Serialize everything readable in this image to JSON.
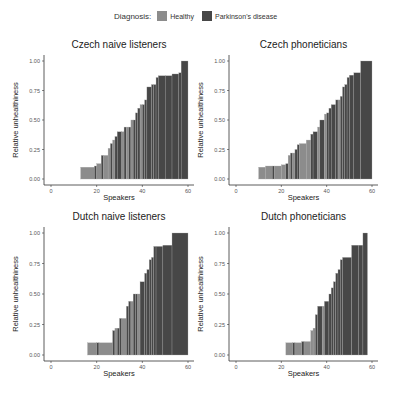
{
  "legend": {
    "title": "Diagnosis:",
    "items": [
      {
        "label": "Healthy",
        "color": "#8c8c8c"
      },
      {
        "label": "Parkinson's disease",
        "color": "#474747"
      }
    ]
  },
  "colors": {
    "healthy": "#8c8c8c",
    "pd": "#474747",
    "separator": "#a9a9a9"
  },
  "chart_data": [
    {
      "type": "bar",
      "title": "Czech naive listeners",
      "xlabel": "Speakers",
      "ylabel": "Relative unhealthiness",
      "xlim": [
        0,
        60
      ],
      "ylim": [
        0,
        1
      ],
      "xticks": [
        "0",
        "20",
        "40",
        "60"
      ],
      "yticks": [
        "0.00",
        "0.25",
        "0.50",
        "0.75",
        "1.00"
      ],
      "steps": [
        {
          "x0": 13,
          "x1": 19,
          "y": 0.1,
          "g": "h"
        },
        {
          "x0": 19,
          "x1": 20,
          "y": 0.11,
          "g": "p"
        },
        {
          "x0": 20,
          "x1": 22,
          "y": 0.13,
          "g": "h"
        },
        {
          "x0": 22,
          "x1": 23,
          "y": 0.2,
          "g": "p"
        },
        {
          "x0": 23,
          "x1": 25,
          "y": 0.2,
          "g": "h"
        },
        {
          "x0": 25,
          "x1": 26,
          "y": 0.26,
          "g": "h"
        },
        {
          "x0": 26,
          "x1": 27,
          "y": 0.3,
          "g": "p"
        },
        {
          "x0": 27,
          "x1": 28,
          "y": 0.33,
          "g": "h"
        },
        {
          "x0": 28,
          "x1": 29,
          "y": 0.36,
          "g": "p"
        },
        {
          "x0": 29,
          "x1": 31,
          "y": 0.4,
          "g": "p"
        },
        {
          "x0": 31,
          "x1": 32,
          "y": 0.4,
          "g": "h"
        },
        {
          "x0": 32,
          "x1": 33,
          "y": 0.44,
          "g": "p"
        },
        {
          "x0": 33,
          "x1": 34,
          "y": 0.44,
          "g": "h"
        },
        {
          "x0": 34,
          "x1": 35,
          "y": 0.44,
          "g": "p"
        },
        {
          "x0": 35,
          "x1": 36,
          "y": 0.5,
          "g": "h"
        },
        {
          "x0": 36,
          "x1": 37,
          "y": 0.5,
          "g": "p"
        },
        {
          "x0": 37,
          "x1": 38,
          "y": 0.56,
          "g": "p"
        },
        {
          "x0": 38,
          "x1": 39,
          "y": 0.6,
          "g": "p"
        },
        {
          "x0": 39,
          "x1": 40,
          "y": 0.63,
          "g": "h"
        },
        {
          "x0": 40,
          "x1": 41,
          "y": 0.63,
          "g": "p"
        },
        {
          "x0": 41,
          "x1": 42,
          "y": 0.67,
          "g": "p"
        },
        {
          "x0": 42,
          "x1": 44,
          "y": 0.78,
          "g": "p"
        },
        {
          "x0": 44,
          "x1": 45,
          "y": 0.8,
          "g": "p"
        },
        {
          "x0": 45,
          "x1": 46,
          "y": 0.8,
          "g": "p"
        },
        {
          "x0": 46,
          "x1": 47,
          "y": 0.86,
          "g": "p"
        },
        {
          "x0": 47,
          "x1": 50,
          "y": 0.875,
          "g": "p"
        },
        {
          "x0": 50,
          "x1": 53,
          "y": 0.875,
          "g": "p"
        },
        {
          "x0": 53,
          "x1": 56,
          "y": 0.89,
          "g": "p"
        },
        {
          "x0": 56,
          "x1": 57,
          "y": 0.9,
          "g": "p"
        },
        {
          "x0": 57,
          "x1": 60,
          "y": 1.0,
          "g": "p"
        }
      ]
    },
    {
      "type": "bar",
      "title": "Czech phoneticians",
      "xlabel": "Speakers",
      "ylabel": "Relative unhealthiness",
      "xlim": [
        0,
        60
      ],
      "ylim": [
        0,
        1
      ],
      "xticks": [
        "0",
        "20",
        "40",
        "60"
      ],
      "yticks": [
        "0.00",
        "0.25",
        "0.50",
        "0.75",
        "1.00"
      ],
      "steps": [
        {
          "x0": 10,
          "x1": 13,
          "y": 0.1,
          "g": "h"
        },
        {
          "x0": 13,
          "x1": 16,
          "y": 0.11,
          "g": "h"
        },
        {
          "x0": 16,
          "x1": 17,
          "y": 0.11,
          "g": "p"
        },
        {
          "x0": 17,
          "x1": 20,
          "y": 0.11,
          "g": "h"
        },
        {
          "x0": 20,
          "x1": 22,
          "y": 0.12,
          "g": "h"
        },
        {
          "x0": 22,
          "x1": 23,
          "y": 0.13,
          "g": "p"
        },
        {
          "x0": 23,
          "x1": 24,
          "y": 0.2,
          "g": "h"
        },
        {
          "x0": 24,
          "x1": 25,
          "y": 0.22,
          "g": "p"
        },
        {
          "x0": 25,
          "x1": 26,
          "y": 0.22,
          "g": "h"
        },
        {
          "x0": 26,
          "x1": 27,
          "y": 0.25,
          "g": "p"
        },
        {
          "x0": 27,
          "x1": 28,
          "y": 0.29,
          "g": "p"
        },
        {
          "x0": 28,
          "x1": 31,
          "y": 0.3,
          "g": "h"
        },
        {
          "x0": 31,
          "x1": 33,
          "y": 0.33,
          "g": "h"
        },
        {
          "x0": 33,
          "x1": 34,
          "y": 0.38,
          "g": "p"
        },
        {
          "x0": 34,
          "x1": 36,
          "y": 0.4,
          "g": "p"
        },
        {
          "x0": 36,
          "x1": 37,
          "y": 0.44,
          "g": "h"
        },
        {
          "x0": 37,
          "x1": 39,
          "y": 0.5,
          "g": "p"
        },
        {
          "x0": 39,
          "x1": 40,
          "y": 0.55,
          "g": "h"
        },
        {
          "x0": 40,
          "x1": 41,
          "y": 0.56,
          "g": "p"
        },
        {
          "x0": 41,
          "x1": 42,
          "y": 0.6,
          "g": "p"
        },
        {
          "x0": 42,
          "x1": 44,
          "y": 0.63,
          "g": "p"
        },
        {
          "x0": 44,
          "x1": 45,
          "y": 0.67,
          "g": "p"
        },
        {
          "x0": 45,
          "x1": 46,
          "y": 0.67,
          "g": "h"
        },
        {
          "x0": 46,
          "x1": 47,
          "y": 0.7,
          "g": "p"
        },
        {
          "x0": 47,
          "x1": 48,
          "y": 0.78,
          "g": "p"
        },
        {
          "x0": 48,
          "x1": 49,
          "y": 0.8,
          "g": "p"
        },
        {
          "x0": 49,
          "x1": 50,
          "y": 0.86,
          "g": "p"
        },
        {
          "x0": 50,
          "x1": 52,
          "y": 0.88,
          "g": "p"
        },
        {
          "x0": 52,
          "x1": 55,
          "y": 0.9,
          "g": "p"
        },
        {
          "x0": 55,
          "x1": 60,
          "y": 1.0,
          "g": "p"
        }
      ]
    },
    {
      "type": "bar",
      "title": "Dutch naive listeners",
      "xlabel": "Speakers",
      "ylabel": "Relative unhealthiness",
      "xlim": [
        0,
        60
      ],
      "ylim": [
        0,
        1
      ],
      "xticks": [
        "0",
        "20",
        "40",
        "60"
      ],
      "yticks": [
        "0.00",
        "0.25",
        "0.50",
        "0.75",
        "1.00"
      ],
      "steps": [
        {
          "x0": 16,
          "x1": 20,
          "y": 0.1,
          "g": "h"
        },
        {
          "x0": 20,
          "x1": 21,
          "y": 0.1,
          "g": "p"
        },
        {
          "x0": 21,
          "x1": 27,
          "y": 0.1,
          "g": "h"
        },
        {
          "x0": 27,
          "x1": 28,
          "y": 0.2,
          "g": "p"
        },
        {
          "x0": 28,
          "x1": 29,
          "y": 0.22,
          "g": "h"
        },
        {
          "x0": 29,
          "x1": 30,
          "y": 0.22,
          "g": "p"
        },
        {
          "x0": 30,
          "x1": 31,
          "y": 0.3,
          "g": "p"
        },
        {
          "x0": 31,
          "x1": 33,
          "y": 0.3,
          "g": "h"
        },
        {
          "x0": 33,
          "x1": 34,
          "y": 0.4,
          "g": "p"
        },
        {
          "x0": 34,
          "x1": 35,
          "y": 0.44,
          "g": "p"
        },
        {
          "x0": 35,
          "x1": 36,
          "y": 0.44,
          "g": "h"
        },
        {
          "x0": 36,
          "x1": 37,
          "y": 0.5,
          "g": "p"
        },
        {
          "x0": 37,
          "x1": 38,
          "y": 0.5,
          "g": "p"
        },
        {
          "x0": 38,
          "x1": 39,
          "y": 0.5,
          "g": "h"
        },
        {
          "x0": 39,
          "x1": 41,
          "y": 0.6,
          "g": "p"
        },
        {
          "x0": 41,
          "x1": 42,
          "y": 0.67,
          "g": "p"
        },
        {
          "x0": 42,
          "x1": 43,
          "y": 0.7,
          "g": "p"
        },
        {
          "x0": 43,
          "x1": 44,
          "y": 0.78,
          "g": "p"
        },
        {
          "x0": 44,
          "x1": 45,
          "y": 0.8,
          "g": "p"
        },
        {
          "x0": 45,
          "x1": 46,
          "y": 0.89,
          "g": "p"
        },
        {
          "x0": 46,
          "x1": 49,
          "y": 0.89,
          "g": "p"
        },
        {
          "x0": 49,
          "x1": 53,
          "y": 0.9,
          "g": "p"
        },
        {
          "x0": 53,
          "x1": 60,
          "y": 1.0,
          "g": "p"
        }
      ]
    },
    {
      "type": "bar",
      "title": "Dutch phoneticians",
      "xlabel": "Speakers",
      "ylabel": "Relative unhealthiness",
      "xlim": [
        0,
        60
      ],
      "ylim": [
        0,
        1
      ],
      "xticks": [
        "0",
        "20",
        "40",
        "60"
      ],
      "yticks": [
        "0.00",
        "0.25",
        "0.50",
        "0.75",
        "1.00"
      ],
      "steps": [
        {
          "x0": 22,
          "x1": 25,
          "y": 0.1,
          "g": "h"
        },
        {
          "x0": 25,
          "x1": 26,
          "y": 0.1,
          "g": "p"
        },
        {
          "x0": 26,
          "x1": 29,
          "y": 0.1,
          "g": "h"
        },
        {
          "x0": 29,
          "x1": 30,
          "y": 0.11,
          "g": "p"
        },
        {
          "x0": 30,
          "x1": 33,
          "y": 0.11,
          "g": "h"
        },
        {
          "x0": 33,
          "x1": 34,
          "y": 0.2,
          "g": "h"
        },
        {
          "x0": 34,
          "x1": 35,
          "y": 0.22,
          "g": "h"
        },
        {
          "x0": 35,
          "x1": 36,
          "y": 0.33,
          "g": "p"
        },
        {
          "x0": 36,
          "x1": 38,
          "y": 0.4,
          "g": "p"
        },
        {
          "x0": 38,
          "x1": 39,
          "y": 0.4,
          "g": "h"
        },
        {
          "x0": 39,
          "x1": 41,
          "y": 0.44,
          "g": "p"
        },
        {
          "x0": 41,
          "x1": 42,
          "y": 0.5,
          "g": "p"
        },
        {
          "x0": 42,
          "x1": 43,
          "y": 0.55,
          "g": "p"
        },
        {
          "x0": 43,
          "x1": 44,
          "y": 0.6,
          "g": "p"
        },
        {
          "x0": 44,
          "x1": 45,
          "y": 0.67,
          "g": "p"
        },
        {
          "x0": 45,
          "x1": 46,
          "y": 0.7,
          "g": "p"
        },
        {
          "x0": 46,
          "x1": 47,
          "y": 0.78,
          "g": "p"
        },
        {
          "x0": 47,
          "x1": 51,
          "y": 0.8,
          "g": "p"
        },
        {
          "x0": 51,
          "x1": 54,
          "y": 0.9,
          "g": "p"
        },
        {
          "x0": 54,
          "x1": 56,
          "y": 0.9,
          "g": "p"
        },
        {
          "x0": 56,
          "x1": 58,
          "y": 1.0,
          "g": "p"
        }
      ]
    }
  ]
}
